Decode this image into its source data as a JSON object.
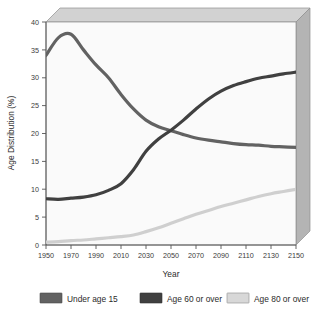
{
  "chart_data": {
    "type": "line",
    "title": "",
    "xlabel": "Year",
    "ylabel": "Age Distribution (%)",
    "xlim": [
      1950,
      2150
    ],
    "ylim": [
      0,
      40
    ],
    "xticks": [
      1950,
      1970,
      1990,
      2010,
      2030,
      2050,
      2070,
      2090,
      2110,
      2130,
      2150
    ],
    "yticks": [
      0,
      5,
      10,
      15,
      20,
      25,
      30,
      35,
      40
    ],
    "grid": false,
    "legend_position": "bottom",
    "x": [
      1950,
      1960,
      1970,
      1980,
      1990,
      2000,
      2010,
      2020,
      2030,
      2040,
      2050,
      2060,
      2070,
      2080,
      2090,
      2100,
      2110,
      2120,
      2130,
      2140,
      2150
    ],
    "series": [
      {
        "name": "Under age 15",
        "color": "#626262",
        "values": [
          34.0,
          37.2,
          37.8,
          35.0,
          32.3,
          30.0,
          27.0,
          24.4,
          22.4,
          21.2,
          20.5,
          19.8,
          19.2,
          18.8,
          18.5,
          18.2,
          18.0,
          17.9,
          17.7,
          17.6,
          17.5
        ]
      },
      {
        "name": "Age 60 or over",
        "color": "#404040",
        "values": [
          8.3,
          8.2,
          8.4,
          8.6,
          9.0,
          9.8,
          11.0,
          13.5,
          16.8,
          19.0,
          20.6,
          22.4,
          24.4,
          26.2,
          27.6,
          28.6,
          29.3,
          29.9,
          30.3,
          30.7,
          31.0
        ]
      },
      {
        "name": "Age 80 or over",
        "color": "#cfcfcf",
        "values": [
          0.5,
          0.6,
          0.8,
          0.9,
          1.1,
          1.3,
          1.5,
          1.8,
          2.4,
          3.1,
          3.9,
          4.7,
          5.5,
          6.2,
          6.9,
          7.5,
          8.1,
          8.7,
          9.2,
          9.6,
          10.0
        ]
      }
    ]
  },
  "legend": {
    "items": [
      {
        "label": "Under age 15",
        "color": "#626262"
      },
      {
        "label": "Age 60 or over",
        "color": "#404040"
      },
      {
        "label": "Age 80 or over",
        "color": "#d8d8d8"
      }
    ]
  },
  "axes": {
    "x_title": "Year",
    "y_title": "Age Distribution (%)"
  },
  "colors": {
    "plot_background": "#fafafa",
    "wall_side": "#b4b4b4",
    "wall_top": "#d2d2d2",
    "axis_line": "#555555",
    "frame_line": "#8a8a8a"
  }
}
